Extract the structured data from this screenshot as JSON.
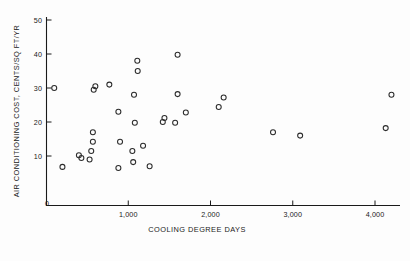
{
  "chart_data": {
    "type": "scatter",
    "title": "",
    "xlabel": "COOLING DEGREE DAYS",
    "ylabel": "AIR CONDITIONING COST, CENTS/SQ FT/YR",
    "xlim": [
      0,
      4400
    ],
    "ylim": [
      0,
      50
    ],
    "grid": false,
    "legend": null,
    "xticks": [
      0,
      1000,
      2000,
      3000,
      4000
    ],
    "xtick_labels": [
      "0",
      "1,000",
      "2,000",
      "3,000",
      "4,000"
    ],
    "yticks": [
      0,
      10,
      20,
      30,
      40,
      50
    ],
    "ytick_labels": [
      "0",
      "10",
      "20",
      "30",
      "40",
      "50"
    ],
    "marker": "open-circle",
    "marker_color": "#2b2b2b",
    "points": [
      [
        100,
        30.0
      ],
      [
        200,
        6.8
      ],
      [
        400,
        10.2
      ],
      [
        430,
        9.4
      ],
      [
        530,
        9.0
      ],
      [
        550,
        11.5
      ],
      [
        570,
        17.0
      ],
      [
        570,
        14.2
      ],
      [
        580,
        29.5
      ],
      [
        600,
        30.5
      ],
      [
        770,
        31.0
      ],
      [
        880,
        23.0
      ],
      [
        880,
        6.5
      ],
      [
        900,
        14.2
      ],
      [
        1050,
        11.5
      ],
      [
        1060,
        8.2
      ],
      [
        1070,
        28.0
      ],
      [
        1080,
        19.8
      ],
      [
        1110,
        38.0
      ],
      [
        1115,
        35.0
      ],
      [
        1180,
        13.0
      ],
      [
        1260,
        7.0
      ],
      [
        1420,
        20.0
      ],
      [
        1440,
        21.2
      ],
      [
        1570,
        19.8
      ],
      [
        1600,
        28.2
      ],
      [
        1600,
        39.8
      ],
      [
        1700,
        22.8
      ],
      [
        2100,
        24.4
      ],
      [
        2160,
        27.2
      ],
      [
        2760,
        17.0
      ],
      [
        3090,
        16.0
      ],
      [
        4130,
        18.2
      ],
      [
        4200,
        28.0
      ]
    ]
  },
  "figure": {
    "background_color": "#ffffff",
    "axis_color": "#1a1a1a"
  }
}
